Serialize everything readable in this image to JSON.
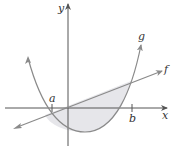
{
  "figure": {
    "type": "area-between-curves",
    "colors": {
      "axis": "#555555",
      "curve": "#8a8a8a",
      "fill": "#e6e6ea"
    },
    "axes": {
      "x_label": "x",
      "y_label": "y"
    },
    "ticks": {
      "a_label": "a",
      "b_label": "b"
    },
    "curves": {
      "parabola_label": "g",
      "line_label": "f"
    }
  }
}
